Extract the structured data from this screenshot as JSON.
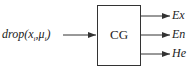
{
  "diagram": {
    "input": {
      "func": "drop",
      "open": "(",
      "x": "x",
      "x_sub": "i",
      "sep": ",",
      "mu": "μ",
      "mu_sub": "i",
      "close": ")"
    },
    "block": {
      "label": "CG"
    },
    "outputs": [
      {
        "label": "Ex"
      },
      {
        "label": "En"
      },
      {
        "label": "He"
      }
    ],
    "colors": {
      "line": "#333333",
      "background": "#ffffff"
    }
  }
}
